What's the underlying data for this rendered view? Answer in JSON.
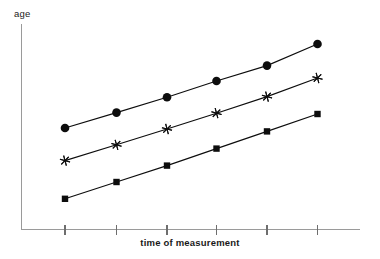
{
  "chart_data": {
    "type": "line",
    "title": "",
    "subtitle": "",
    "xlabel": "time of measurement",
    "ylabel": "age",
    "grid": false,
    "legend": "none",
    "annotations": [],
    "x": [
      1,
      2,
      3,
      4,
      5,
      6
    ],
    "xtick_labels": [
      "",
      "",
      "",
      "",
      "",
      ""
    ],
    "ytick_labels": [],
    "xlim": [
      0.6,
      6.6
    ],
    "ylim": [
      0,
      10
    ],
    "x_pixels": [
      65,
      116.5,
      167,
      216.5,
      267,
      317.5
    ],
    "series": [
      {
        "name": "oldest cohort",
        "marker": "filled-circle",
        "values": [
          5.05,
          5.83,
          6.6,
          7.41,
          8.19,
          8.98
        ],
        "y_pixels": [
          128,
          112.6,
          97.2,
          81,
          65.6,
          44
        ]
      },
      {
        "name": "middle cohort",
        "marker": "six-point-asterisk",
        "values": [
          3.46,
          4.24,
          5.02,
          5.8,
          6.63,
          7.5
        ],
        "y_pixels": [
          160.6,
          144.8,
          129,
          113.2,
          96.6,
          78
        ]
      },
      {
        "name": "youngest cohort",
        "marker": "filled-square",
        "values": [
          1.65,
          2.48,
          3.26,
          4.09,
          4.92,
          5.75
        ],
        "y_pixels": [
          198.8,
          182,
          165.6,
          148.6,
          131.4,
          114
        ]
      }
    ]
  },
  "axes": {
    "y_axis_label": "age",
    "x_axis_label": "time of measurement",
    "x_axis_tick_count": 6,
    "y_axis_tick_count": 0
  },
  "colors": {
    "background": "#ffffff",
    "axis": "#9a9a9a",
    "tick": "#6e6e6e",
    "series": "#0d0d0d",
    "text": "#1a1a1a"
  }
}
